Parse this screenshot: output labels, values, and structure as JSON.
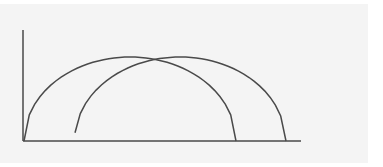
{
  "diagram": {
    "type": "two overlapping parabolic trajectories on axes",
    "colors": {
      "background": "#f4f4f4",
      "stroke": "#4a4a4a"
    },
    "axes": {
      "origin": [
        23,
        141
      ],
      "y_axis_top": [
        23,
        30
      ],
      "x_axis_end": [
        301,
        141
      ]
    },
    "curves": [
      {
        "name": "arc-1",
        "start": [
          24,
          141
        ],
        "peak": [
          130,
          57
        ],
        "end": [
          236,
          141
        ]
      },
      {
        "name": "arc-2",
        "start": [
          75,
          141
        ],
        "peak": [
          180,
          57
        ],
        "end": [
          286,
          141
        ]
      }
    ]
  }
}
